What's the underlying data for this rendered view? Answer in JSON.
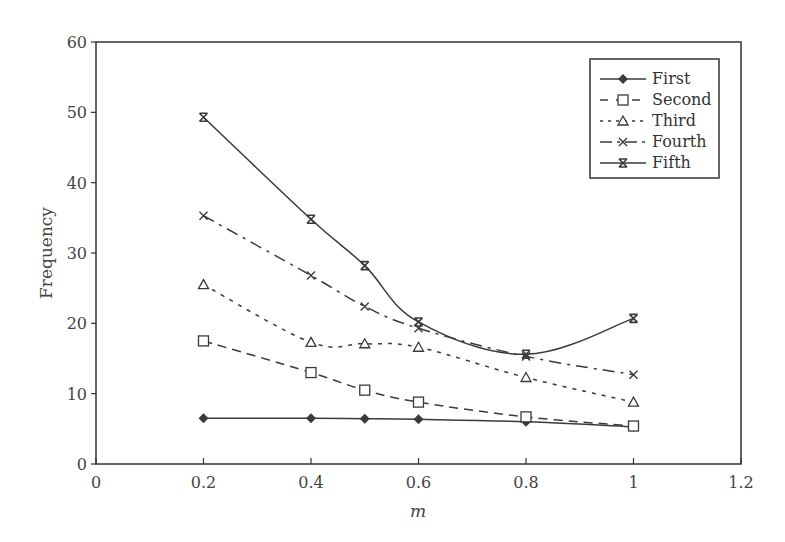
{
  "chart_data": {
    "type": "line",
    "title": "",
    "xlabel": "m",
    "ylabel": "Frequency",
    "x": [
      0.2,
      0.4,
      0.5,
      0.6,
      0.8,
      1.0
    ],
    "xlim": [
      0,
      1.2
    ],
    "ylim": [
      0,
      60
    ],
    "xticks": [
      "0",
      "0.2",
      "0.4",
      "0.6",
      "0.8",
      "1",
      "1.2"
    ],
    "yticks": [
      "0",
      "10",
      "20",
      "30",
      "40",
      "50",
      "60"
    ],
    "grid": false,
    "legend_position": "upper right (inside)",
    "series": [
      {
        "name": "First",
        "marker": "filled-diamond",
        "line": "solid",
        "values": [
          6.5,
          6.5,
          6.45,
          6.35,
          6.0,
          5.3
        ]
      },
      {
        "name": "Second",
        "marker": "open-square",
        "line": "dashed",
        "values": [
          17.5,
          13.0,
          10.5,
          8.8,
          6.7,
          5.4
        ]
      },
      {
        "name": "Third",
        "marker": "open-triangle",
        "line": "dotted",
        "values": [
          25.5,
          17.3,
          17.1,
          16.6,
          12.3,
          8.8
        ]
      },
      {
        "name": "Fourth",
        "marker": "x",
        "line": "dash-dot",
        "values": [
          35.3,
          26.8,
          22.4,
          19.3,
          15.3,
          12.7
        ]
      },
      {
        "name": "Fifth",
        "marker": "asterisk-x",
        "line": "solid",
        "values": [
          49.3,
          34.8,
          28.2,
          20.2,
          15.6,
          20.7
        ]
      }
    ]
  },
  "colors": {
    "line": "#3a3a3a",
    "axis": "#333333",
    "background": "#ffffff"
  }
}
